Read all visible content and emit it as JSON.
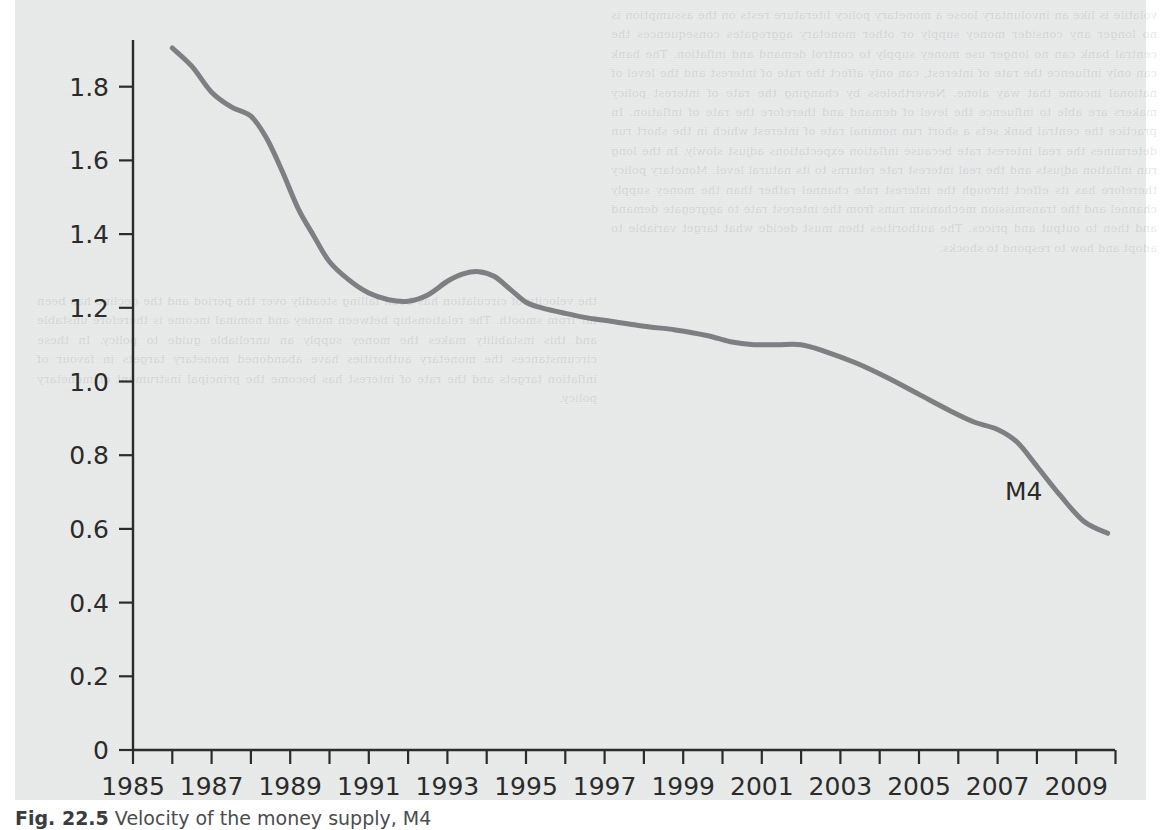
{
  "figure": {
    "caption_number": "Fig. 22.5",
    "caption_text": "Velocity of the money supply, M4",
    "series_label": "M4"
  },
  "chart_data": {
    "type": "line",
    "title": "Velocity of the money supply, M4",
    "xlabel": "",
    "ylabel": "",
    "xlim": [
      1985,
      2010
    ],
    "ylim": [
      0,
      1.9
    ],
    "grid": false,
    "legend": "inline-label",
    "legend_position": "right-inside",
    "x_tick_labels": [
      "1985",
      "1987",
      "1989",
      "1991",
      "1993",
      "1995",
      "1997",
      "1999",
      "2001",
      "2003",
      "2005",
      "2007",
      "2009"
    ],
    "x_minor_ticks": [
      1986,
      1988,
      1990,
      1992,
      1994,
      1996,
      1998,
      2000,
      2002,
      2004,
      2006,
      2008,
      2010
    ],
    "y_tick_labels": [
      "0",
      "0.2",
      "0.4",
      "0.6",
      "0.8",
      "1.0",
      "1.2",
      "1.4",
      "1.6",
      "1.8"
    ],
    "y_ticks": [
      0,
      0.2,
      0.4,
      0.6,
      0.8,
      1.0,
      1.2,
      1.4,
      1.6,
      1.8
    ],
    "series": [
      {
        "name": "M4",
        "color": "#7d7f82",
        "x": [
          1986.0,
          1986.5,
          1987.0,
          1987.5,
          1988.0,
          1988.4,
          1988.8,
          1989.2,
          1989.6,
          1990.0,
          1990.5,
          1991.0,
          1991.5,
          1992.0,
          1992.5,
          1993.0,
          1993.4,
          1993.8,
          1994.2,
          1994.6,
          1995.0,
          1995.4,
          1996.0,
          1996.6,
          1997.2,
          1998.0,
          1998.8,
          1999.6,
          2000.2,
          2000.8,
          2001.4,
          2002.0,
          2002.6,
          2003.4,
          2004.2,
          2005.0,
          2005.8,
          2006.4,
          2007.0,
          2007.5,
          2008.0,
          2008.6,
          2009.2,
          2009.8
        ],
        "y": [
          1.905,
          1.855,
          1.785,
          1.745,
          1.72,
          1.66,
          1.57,
          1.47,
          1.395,
          1.325,
          1.275,
          1.24,
          1.222,
          1.218,
          1.235,
          1.272,
          1.292,
          1.298,
          1.285,
          1.25,
          1.215,
          1.2,
          1.185,
          1.172,
          1.163,
          1.15,
          1.14,
          1.125,
          1.108,
          1.1,
          1.1,
          1.1,
          1.082,
          1.05,
          1.01,
          0.965,
          0.92,
          0.89,
          0.87,
          0.835,
          0.77,
          0.69,
          0.62,
          0.588
        ]
      }
    ]
  },
  "ghost_text": {
    "right_block": "volatile is like an involuntary loose a monetary policy literature rests on the assumption is no longer any consider money supply or other monetary aggregates consequences the central bank can no longer use money supply to control demand and inflation. The bank can only influence the rate of interest, can only affect the rate of interest and the level of national income that way alone. Nevertheless by changing the rate of interest policy makers are able to influence the level of demand and therefore the rate of inflation. In practice the central bank sets a short run nominal rate of interest which in the short run determines the real interest rate because inflation expectations adjust slowly. In the long run inflation adjusts and the real interest rate returns to its natural level. Monetary policy therefore has its effect through the interest rate channel rather than the money supply channel and the transmission mechanism runs from the interest rate to aggregate demand and then to output and prices. The authorities then must decide what target variable to adopt and how to respond to shocks.",
    "left_block": "the velocity of circulation has been falling steadily over the period and the decline has been far from smooth. The relationship between money and nominal income is therefore unstable and this instability makes the money supply an unreliable guide to policy. In these circumstances the monetary authorities have abandoned monetary targets in favour of inflation targets and the rate of interest has become the principal instrument of monetary policy."
  }
}
